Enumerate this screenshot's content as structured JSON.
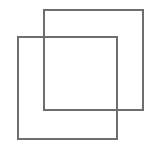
{
  "canvas": {
    "width": 156,
    "height": 144,
    "background": "#ffffff"
  },
  "icon": {
    "name": "overlapping-squares-icon",
    "stroke_color": "#6e6e6e",
    "stroke_width": 2
  },
  "shapes": [
    {
      "name": "back-square",
      "x": 43,
      "y": 9,
      "width": 101,
      "height": 102
    },
    {
      "name": "front-square",
      "x": 17,
      "y": 36,
      "width": 101,
      "height": 104
    }
  ]
}
